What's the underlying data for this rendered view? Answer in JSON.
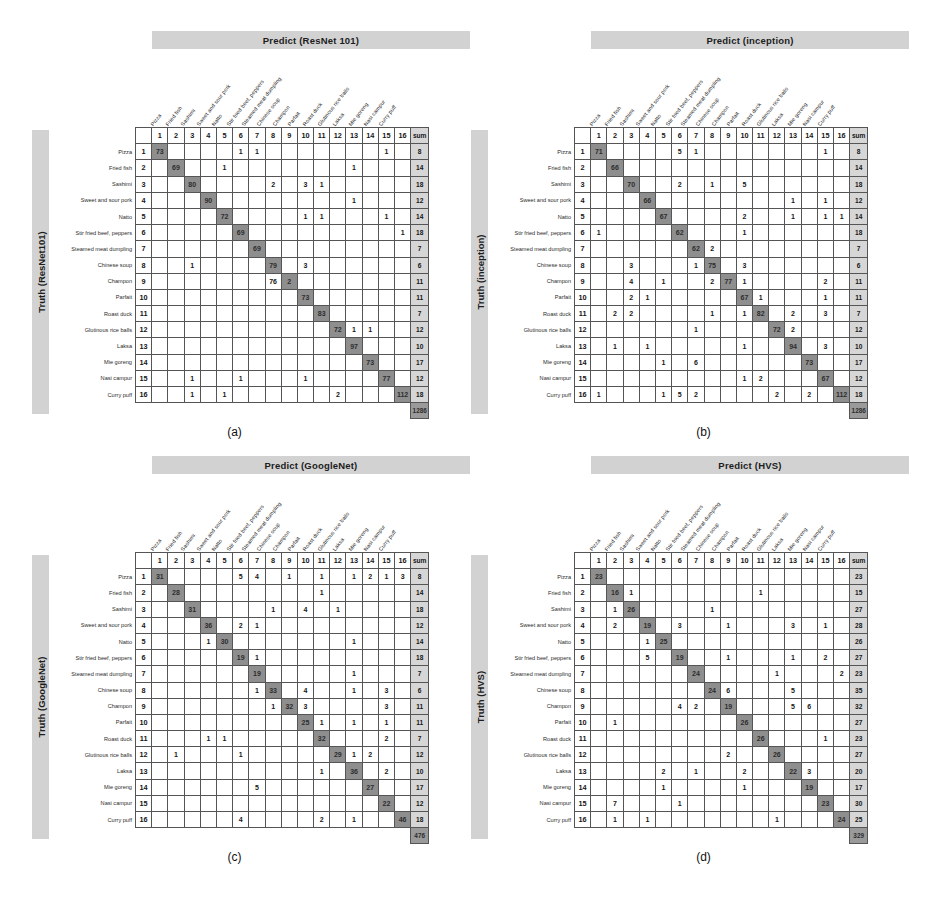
{
  "classes": [
    "Pizza",
    "Fried fish",
    "Sashimi",
    "Sweet and sour pork",
    "Natto",
    "Stir fried beef, peppers",
    "Steamed meat dumpling",
    "Chinese soup",
    "Champon",
    "Parfait",
    "Roast duck",
    "Glutinous rice balls",
    "Laksa",
    "Mie goreng",
    "Nasi campur",
    "Curry puff"
  ],
  "col_indices": [
    "1",
    "2",
    "3",
    "4",
    "5",
    "6",
    "7",
    "8",
    "9",
    "10",
    "11",
    "12",
    "13",
    "14",
    "15",
    "16"
  ],
  "sum_header": "sum",
  "colors": {
    "header_bar": "#d2d2d2",
    "diagonal_cell": "#8e8e8e",
    "sum_cell": "#d6d6d6",
    "grand_total_cell": "#9a9a9a",
    "grid_line": "#555555"
  },
  "panels": [
    {
      "id": "a",
      "caption": "(a)",
      "title": "Predict (ResNet 101)",
      "side_label": "Truth (ResNet101)",
      "grand_total": "1286",
      "sums": [
        "8",
        "14",
        "18",
        "12",
        "14",
        "18",
        "7",
        "6",
        "11",
        "11",
        "7",
        "12",
        "10",
        "17",
        "12",
        "18"
      ],
      "matrix": [
        [
          "73",
          "",
          "",
          "",
          "",
          "1",
          "1",
          "",
          "",
          "",
          "",
          "",
          "",
          "",
          "1",
          ""
        ],
        [
          "",
          "69",
          "",
          "",
          "1",
          "",
          "",
          "",
          "",
          "",
          "",
          "",
          "1",
          "",
          "",
          ""
        ],
        [
          "",
          "",
          "80",
          "",
          "",
          "",
          "",
          "2",
          "",
          "3",
          "1",
          "",
          "",
          "",
          "",
          ""
        ],
        [
          "",
          "",
          "",
          "90",
          "",
          "",
          "",
          "",
          "",
          "",
          "",
          "",
          "1",
          "",
          "",
          ""
        ],
        [
          "",
          "",
          "",
          "",
          "72",
          "",
          "",
          "",
          "",
          "1",
          "1",
          "",
          "",
          "",
          "1",
          ""
        ],
        [
          "",
          "",
          "",
          "",
          "",
          "69",
          "",
          "",
          "",
          "",
          "",
          "",
          "",
          "",
          "",
          "1"
        ],
        [
          "",
          "",
          "",
          "",
          "",
          "",
          "69",
          "",
          "",
          "",
          "",
          "",
          "",
          "",
          "",
          ""
        ],
        [
          "",
          "",
          "1",
          "",
          "",
          "",
          "",
          "79",
          "",
          "3",
          "",
          "",
          "",
          "",
          "",
          ""
        ],
        [
          "",
          "",
          "",
          "",
          "",
          "",
          "",
          "76",
          "2",
          "",
          "",
          "",
          "",
          "",
          "",
          ""
        ],
        [
          "",
          "",
          "",
          "",
          "",
          "",
          "",
          "",
          "",
          "73",
          "",
          "",
          "",
          "",
          "",
          ""
        ],
        [
          "",
          "",
          "",
          "",
          "",
          "",
          "",
          "",
          "",
          "",
          "83",
          "",
          "",
          "",
          "",
          ""
        ],
        [
          "",
          "",
          "",
          "",
          "",
          "",
          "",
          "",
          "",
          "",
          "",
          "72",
          "1",
          "1",
          "",
          ""
        ],
        [
          "",
          "",
          "",
          "",
          "",
          "",
          "",
          "",
          "",
          "",
          "",
          "",
          "97",
          "",
          "",
          ""
        ],
        [
          "",
          "",
          "",
          "",
          "",
          "",
          "",
          "",
          "",
          "",
          "",
          "",
          "",
          "73",
          "",
          ""
        ],
        [
          "",
          "",
          "1",
          "",
          "",
          "1",
          "",
          "",
          "",
          "1",
          "",
          "",
          "",
          "",
          "77",
          ""
        ],
        [
          "",
          "",
          "1",
          "",
          "1",
          "",
          "",
          "",
          "",
          "",
          "",
          "2",
          "",
          "",
          "",
          "112"
        ]
      ]
    },
    {
      "id": "b",
      "caption": "(b)",
      "title": "Predict (inception)",
      "side_label": "Truth (inception)",
      "grand_total": "1286",
      "sums": [
        "8",
        "14",
        "18",
        "12",
        "14",
        "18",
        "7",
        "6",
        "11",
        "11",
        "7",
        "12",
        "10",
        "17",
        "12",
        "18"
      ],
      "matrix": [
        [
          "71",
          "",
          "",
          "",
          "",
          "5",
          "1",
          "",
          "",
          "",
          "",
          "",
          "",
          "",
          "1",
          ""
        ],
        [
          "",
          "66",
          "",
          "",
          "",
          "",
          "",
          "",
          "",
          "",
          "",
          "",
          "",
          "",
          "",
          ""
        ],
        [
          "",
          "",
          "70",
          "",
          "",
          "2",
          "",
          "1",
          "",
          "5",
          "",
          "",
          "",
          "",
          "",
          ""
        ],
        [
          "",
          "",
          "",
          "66",
          "",
          "",
          "",
          "",
          "",
          "",
          "",
          "",
          "1",
          "",
          "1",
          ""
        ],
        [
          "",
          "",
          "",
          "",
          "67",
          "",
          "",
          "",
          "",
          "2",
          "",
          "",
          "1",
          "",
          "1",
          "1"
        ],
        [
          "1",
          "",
          "",
          "",
          "",
          "62",
          "",
          "",
          "",
          "1",
          "",
          "",
          "",
          "",
          "",
          ""
        ],
        [
          "",
          "",
          "",
          "",
          "",
          "",
          "62",
          "2",
          "",
          "",
          "",
          "",
          "",
          "",
          "",
          ""
        ],
        [
          "",
          "",
          "3",
          "",
          "",
          "",
          "1",
          "75",
          "",
          "3",
          "",
          "",
          "",
          "",
          "",
          ""
        ],
        [
          "",
          "",
          "4",
          "",
          "1",
          "",
          "",
          "2",
          "77",
          "1",
          "",
          "",
          "",
          "",
          "2",
          ""
        ],
        [
          "",
          "",
          "2",
          "1",
          "",
          "",
          "",
          "",
          "",
          "67",
          "1",
          "",
          "",
          "",
          "1",
          ""
        ],
        [
          "",
          "2",
          "2",
          "",
          "",
          "",
          "",
          "1",
          "",
          "1",
          "82",
          "",
          "2",
          "",
          "3",
          ""
        ],
        [
          "",
          "",
          "",
          "",
          "",
          "",
          "1",
          "",
          "",
          "",
          "",
          "72",
          "2",
          "",
          "",
          ""
        ],
        [
          "",
          "1",
          "",
          "1",
          "",
          "",
          "",
          "",
          "",
          "1",
          "",
          "",
          "94",
          "",
          "3",
          ""
        ],
        [
          "",
          "",
          "",
          "",
          "1",
          "",
          "6",
          "",
          "",
          "",
          "",
          "",
          "",
          "73",
          "",
          ""
        ],
        [
          "",
          "",
          "",
          "",
          "",
          "",
          "",
          "",
          "",
          "1",
          "2",
          "",
          "",
          "",
          "67",
          ""
        ],
        [
          "1",
          "",
          "",
          "",
          "1",
          "5",
          "2",
          "",
          "",
          "",
          "",
          "2",
          "",
          "2",
          "",
          "112"
        ]
      ]
    },
    {
      "id": "c",
      "caption": "(c)",
      "title": "Predict (GoogleNet)",
      "side_label": "Truth (GoogleNet)",
      "grand_total": "476",
      "sums": [
        "8",
        "14",
        "18",
        "12",
        "14",
        "18",
        "7",
        "6",
        "11",
        "11",
        "7",
        "12",
        "10",
        "17",
        "12",
        "18"
      ],
      "matrix": [
        [
          "31",
          "",
          "",
          "",
          "",
          "5",
          "4",
          "",
          "1",
          "",
          "1",
          "",
          "1",
          "2",
          "1",
          "3"
        ],
        [
          "",
          "28",
          "",
          "",
          "",
          "",
          "",
          "",
          "",
          "",
          "1",
          "",
          "",
          "",
          "",
          ""
        ],
        [
          "",
          "",
          "31",
          "",
          "",
          "",
          "",
          "1",
          "",
          "4",
          "",
          "1",
          "",
          "",
          "",
          ""
        ],
        [
          "",
          "",
          "",
          "36",
          "",
          "2",
          "1",
          "",
          "",
          "",
          "",
          "",
          "",
          "",
          "",
          ""
        ],
        [
          "",
          "",
          "",
          "1",
          "30",
          "",
          "",
          "",
          "",
          "",
          "",
          "",
          "1",
          "",
          "",
          ""
        ],
        [
          "",
          "",
          "",
          "",
          "",
          "19",
          "1",
          "",
          "",
          "",
          "",
          "",
          "",
          "",
          "",
          ""
        ],
        [
          "",
          "",
          "",
          "",
          "",
          "",
          "19",
          "",
          "",
          "",
          "",
          "",
          "1",
          "",
          "",
          ""
        ],
        [
          "",
          "",
          "",
          "",
          "",
          "",
          "1",
          "33",
          "",
          "4",
          "",
          "",
          "1",
          "",
          "3",
          ""
        ],
        [
          "",
          "",
          "",
          "",
          "",
          "",
          "",
          "1",
          "32",
          "3",
          "",
          "",
          "",
          "",
          "3",
          ""
        ],
        [
          "",
          "",
          "",
          "",
          "",
          "",
          "",
          "",
          "",
          "25",
          "1",
          "",
          "1",
          "",
          "1",
          ""
        ],
        [
          "",
          "",
          "",
          "1",
          "1",
          "",
          "",
          "",
          "",
          "",
          "32",
          "",
          "",
          "",
          "2",
          ""
        ],
        [
          "",
          "1",
          "",
          "",
          "",
          "1",
          "",
          "",
          "",
          "",
          "",
          "29",
          "1",
          "2",
          "",
          ""
        ],
        [
          "",
          "",
          "",
          "",
          "",
          "",
          "",
          "",
          "",
          "",
          "1",
          "",
          "36",
          "",
          "2",
          ""
        ],
        [
          "",
          "",
          "",
          "",
          "",
          "",
          "5",
          "",
          "",
          "",
          "",
          "",
          "",
          "27",
          "",
          ""
        ],
        [
          "",
          "",
          "",
          "",
          "",
          "",
          "",
          "",
          "",
          "",
          "",
          "",
          "",
          "",
          "22",
          ""
        ],
        [
          "",
          "",
          "",
          "",
          "",
          "4",
          "",
          "",
          "",
          "",
          "2",
          "",
          "1",
          "",
          "",
          "46"
        ]
      ]
    },
    {
      "id": "d",
      "caption": "(d)",
      "title": "Predict (HVS)",
      "side_label": "Truth (HVS)",
      "grand_total": "329",
      "sums": [
        "23",
        "15",
        "27",
        "28",
        "26",
        "27",
        "23",
        "35",
        "32",
        "27",
        "23",
        "27",
        "20",
        "17",
        "30",
        "25"
      ],
      "matrix": [
        [
          "23",
          "",
          "",
          "",
          "",
          "",
          "",
          "",
          "",
          "",
          "",
          "",
          "",
          "",
          "",
          ""
        ],
        [
          "",
          "16",
          "1",
          "",
          "",
          "",
          "",
          "",
          "",
          "",
          "1",
          "",
          "",
          "",
          "",
          ""
        ],
        [
          "",
          "1",
          "26",
          "",
          "",
          "",
          "",
          "1",
          "",
          "",
          "",
          "",
          "",
          "",
          "",
          ""
        ],
        [
          "",
          "2",
          "",
          "19",
          "",
          "3",
          "",
          "",
          "1",
          "",
          "",
          "",
          "3",
          "",
          "1",
          ""
        ],
        [
          "",
          "",
          "",
          "1",
          "25",
          "",
          "",
          "",
          "",
          "",
          "",
          "",
          "",
          "",
          "",
          ""
        ],
        [
          "",
          "",
          "",
          "5",
          "",
          "19",
          "",
          "",
          "1",
          "",
          "",
          "",
          "1",
          "",
          "2",
          ""
        ],
        [
          "",
          "",
          "",
          "",
          "",
          "",
          "24",
          "",
          "",
          "",
          "",
          "1",
          "",
          "",
          "",
          "2"
        ],
        [
          "",
          "",
          "",
          "",
          "",
          "",
          "",
          "24",
          "6",
          "",
          "",
          "",
          "5",
          "",
          "",
          ""
        ],
        [
          "",
          "",
          "",
          "",
          "",
          "4",
          "2",
          "",
          "19",
          "",
          "",
          "",
          "5",
          "6",
          "",
          ""
        ],
        [
          "",
          "1",
          "",
          "",
          "",
          "",
          "",
          "",
          "",
          "26",
          "",
          "",
          "",
          "",
          "",
          ""
        ],
        [
          "",
          "",
          "",
          "",
          "",
          "",
          "",
          "",
          "",
          "",
          "26",
          "",
          "",
          "",
          "1",
          ""
        ],
        [
          "",
          "",
          "",
          "",
          "",
          "",
          "",
          "",
          "2",
          "",
          "",
          "26",
          "",
          "",
          "",
          ""
        ],
        [
          "",
          "",
          "",
          "",
          "2",
          "",
          "1",
          "",
          "",
          "2",
          "",
          "",
          "22",
          "3",
          "",
          ""
        ],
        [
          "",
          "",
          "",
          "",
          "1",
          "",
          "",
          "",
          "",
          "1",
          "",
          "",
          "",
          "19",
          "",
          ""
        ],
        [
          "",
          "7",
          "",
          "",
          "",
          "1",
          "",
          "",
          "",
          "",
          "",
          "",
          "",
          "",
          "23",
          ""
        ],
        [
          "",
          "1",
          "",
          "1",
          "",
          "",
          "",
          "",
          "",
          "",
          "",
          "1",
          "",
          "",
          "",
          "24"
        ]
      ]
    }
  ]
}
